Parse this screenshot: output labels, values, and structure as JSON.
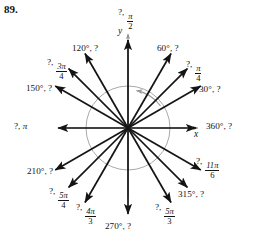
{
  "problem": {
    "number": "89."
  },
  "figure": {
    "type": "unit-circle-angle-diagram",
    "origin": {
      "x": 128,
      "y": 128
    },
    "circle_radius": 42,
    "axes": {
      "x_label": "x",
      "y_label": "y",
      "x_axis_from": [
        62,
        128
      ],
      "x_axis_to": [
        196,
        128
      ],
      "y_axis_from": [
        128,
        196
      ],
      "y_axis_to": [
        128,
        36
      ]
    },
    "rotation_arc": {
      "direction": "counterclockwise",
      "color": "#9a9a9a"
    },
    "colors": {
      "ray": "#141414",
      "axis": "#8c8c8c",
      "circle": "#9e9e9e",
      "text": "#141414",
      "background": "#ffffff"
    },
    "rays": [
      {
        "name": "ray-90",
        "angle_deg": 90,
        "length": 88,
        "label_degrees": "?",
        "label_radians_num": "π",
        "label_radians_den": "2",
        "label_text": "?, π/2",
        "label_x": 118,
        "label_y": 8,
        "label_align": "left"
      },
      {
        "name": "ray-60",
        "angle_deg": 60,
        "length": 86,
        "label_degrees": "60°",
        "label_radians_num": "",
        "label_radians_den": "",
        "label_text": "60°, ?",
        "label_x": 157,
        "label_y": 44,
        "label_align": "left"
      },
      {
        "name": "ray-45",
        "angle_deg": 45,
        "length": 84,
        "label_degrees": "?",
        "label_radians_num": "π",
        "label_radians_den": "4",
        "label_text": "?, π/4",
        "label_x": 186,
        "label_y": 60,
        "label_align": "left"
      },
      {
        "name": "ray-30",
        "angle_deg": 30,
        "length": 84,
        "label_degrees": "30°",
        "label_radians_num": "",
        "label_radians_den": "",
        "label_text": "30°, ?",
        "label_x": 199,
        "label_y": 85,
        "label_align": "left"
      },
      {
        "name": "ray-0",
        "angle_deg": 0,
        "length": 68,
        "label_degrees": "360°",
        "label_radians_num": "",
        "label_radians_den": "",
        "label_text": "360°, ?",
        "label_x": 206,
        "label_y": 122,
        "label_align": "left"
      },
      {
        "name": "ray-120",
        "angle_deg": 120,
        "length": 86,
        "label_degrees": "120°",
        "label_radians_num": "",
        "label_radians_den": "",
        "label_text": "120°, ?",
        "label_x": 72,
        "label_y": 44,
        "label_align": "left"
      },
      {
        "name": "ray-135",
        "angle_deg": 135,
        "length": 84,
        "label_degrees": "?",
        "label_radians_num": "3π",
        "label_radians_den": "4",
        "label_text": "?, 3π/4",
        "label_x": 47,
        "label_y": 58,
        "label_align": "left"
      },
      {
        "name": "ray-150",
        "angle_deg": 150,
        "length": 84,
        "label_degrees": "150°",
        "label_radians_num": "",
        "label_radians_den": "",
        "label_text": "150°, ?",
        "label_x": 26,
        "label_y": 84,
        "label_align": "left"
      },
      {
        "name": "ray-180",
        "angle_deg": 180,
        "length": 70,
        "label_degrees": "?",
        "label_radians_num": "",
        "label_radians_den": "",
        "label_text": "?, π",
        "label_x": 14,
        "label_y": 122,
        "label_align": "left"
      },
      {
        "name": "ray-210",
        "angle_deg": 210,
        "length": 84,
        "label_degrees": "210°",
        "label_radians_num": "",
        "label_radians_den": "",
        "label_text": "210°, ?",
        "label_x": 27,
        "label_y": 167,
        "label_align": "left"
      },
      {
        "name": "ray-225",
        "angle_deg": 225,
        "length": 84,
        "label_degrees": "?",
        "label_radians_num": "5π",
        "label_radians_den": "4",
        "label_text": "?, 5π/4",
        "label_x": 49,
        "label_y": 187,
        "label_align": "left"
      },
      {
        "name": "ray-240",
        "angle_deg": 240,
        "length": 86,
        "label_degrees": "?",
        "label_radians_num": "4π",
        "label_radians_den": "3",
        "label_text": "?, 4π/3",
        "label_x": 76,
        "label_y": 203,
        "label_align": "left"
      },
      {
        "name": "ray-270",
        "angle_deg": 270,
        "length": 86,
        "label_degrees": "270°",
        "label_radians_num": "",
        "label_radians_den": "",
        "label_text": "270°, ?",
        "label_x": 105,
        "label_y": 222,
        "label_align": "left"
      },
      {
        "name": "ray-300",
        "angle_deg": 300,
        "length": 86,
        "label_degrees": "?",
        "label_radians_num": "5π",
        "label_radians_den": "3",
        "label_text": "?, 5π/3",
        "label_x": 155,
        "label_y": 203,
        "label_align": "left"
      },
      {
        "name": "ray-315",
        "angle_deg": 315,
        "length": 84,
        "label_degrees": "315°",
        "label_radians_num": "",
        "label_radians_den": "",
        "label_text": "315°, ?",
        "label_x": 178,
        "label_y": 190,
        "label_align": "left"
      },
      {
        "name": "ray-330",
        "angle_deg": 330,
        "length": 84,
        "label_degrees": "?",
        "label_radians_num": "11π",
        "label_radians_den": "6",
        "label_text": "?, 11π/6",
        "label_x": 196,
        "label_y": 157,
        "label_align": "left"
      }
    ]
  }
}
